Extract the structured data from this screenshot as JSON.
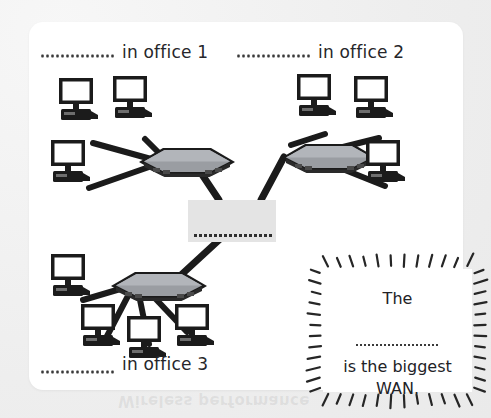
{
  "page": {
    "ghost_text": "Wireless performance",
    "background_color": "#f2f2f2",
    "card_color": "#ffffff"
  },
  "diagram": {
    "type": "network-topology",
    "ink_color": "#1b1b1b",
    "switch_color": "#8a8d92",
    "cloud_color": "#e4e4e4",
    "labels": [
      {
        "id": "office-1",
        "text": "in office 1",
        "blank_before": true
      },
      {
        "id": "office-2",
        "text": "in office 2",
        "blank_before": true
      },
      {
        "id": "office-3",
        "text": "in office 3",
        "blank_before": true
      }
    ],
    "center": {
      "id": "wan-cloud",
      "shape": "rectangle",
      "fill": "#e4e4e4",
      "blank_label": true,
      "blank_dot_count": 16
    },
    "offices": [
      {
        "id": "office-1",
        "label": "in office 1",
        "computer_count": 3,
        "switch_side": "right"
      },
      {
        "id": "office-2",
        "label": "in office 2",
        "computer_count": 3,
        "switch_side": "left"
      },
      {
        "id": "office-3",
        "label": "in office 3",
        "computer_count": 4,
        "switch_side": "top"
      }
    ]
  },
  "callout": {
    "style": "starburst",
    "ray_count": 48,
    "line1": "The",
    "blank": true,
    "line2": "is the biggest",
    "line3": "WAN."
  }
}
